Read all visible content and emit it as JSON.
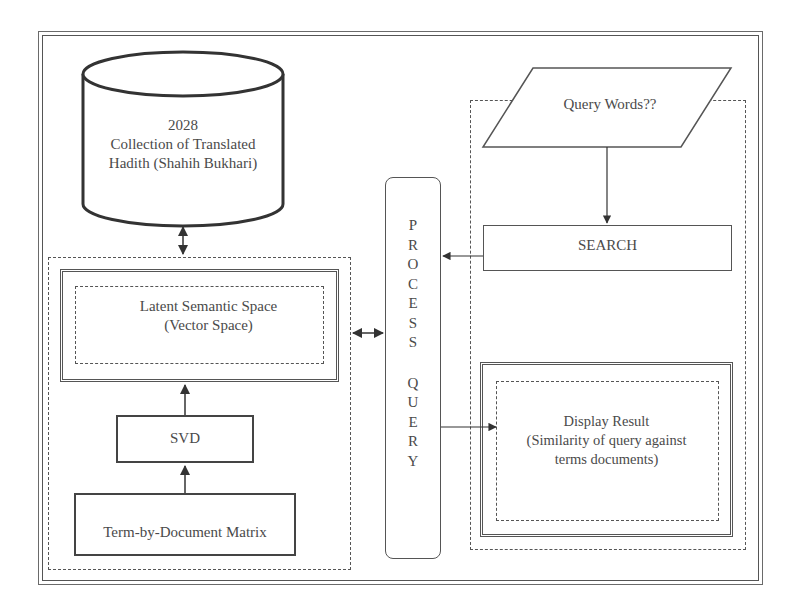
{
  "diagram": {
    "type": "flowchart",
    "database": {
      "shape": "cylinder",
      "lines": [
        "2028",
        "Collection of Translated",
        "Hadith (Shahih Bukhari)"
      ]
    },
    "query_input": {
      "shape": "parallelogram",
      "label": "Query Words??"
    },
    "search": {
      "label": "SEARCH"
    },
    "process_query": {
      "word1": [
        "P",
        "R",
        "O",
        "C",
        "E",
        "S",
        "S"
      ],
      "word2": [
        "Q",
        "U",
        "E",
        "R",
        "Y"
      ]
    },
    "latent_space": {
      "lines": [
        "Latent Semantic Space",
        "(Vector Space)"
      ]
    },
    "svd": {
      "label": "SVD"
    },
    "term_matrix": {
      "label": "Term-by-Document Matrix"
    },
    "display_result": {
      "lines": [
        "Display Result",
        "(Similarity of query against",
        "terms documents)"
      ]
    },
    "edges": [
      {
        "from": "database",
        "to": "latent_space_group",
        "type": "bidirectional"
      },
      {
        "from": "term_matrix",
        "to": "svd",
        "type": "directed"
      },
      {
        "from": "svd",
        "to": "latent_space",
        "type": "directed"
      },
      {
        "from": "latent_space_group",
        "to": "process_query",
        "type": "bidirectional"
      },
      {
        "from": "query_input",
        "to": "search",
        "type": "directed"
      },
      {
        "from": "search",
        "to": "process_query",
        "type": "directed"
      },
      {
        "from": "process_query",
        "to": "display_result",
        "type": "directed"
      }
    ],
    "colors": {
      "stroke": "#444444",
      "text": "#4a4a4a",
      "background": "#ffffff"
    }
  }
}
